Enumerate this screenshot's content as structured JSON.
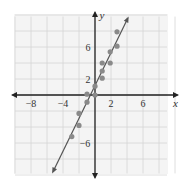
{
  "chart_data": {
    "type": "scatter",
    "title": "",
    "xlabel": "x",
    "ylabel": "y",
    "xlim": [
      -10,
      10
    ],
    "ylim": [
      -10,
      10
    ],
    "grid": true,
    "grid_step": 2,
    "x_tick_labels": [
      "-8",
      "-4",
      "2",
      "6"
    ],
    "y_tick_labels": [
      "2",
      "6",
      "-6"
    ],
    "series": [
      {
        "name": "data points",
        "points": [
          [
            2.75,
            7.9
          ],
          [
            2.75,
            6.1
          ],
          [
            1.9,
            5.4
          ],
          [
            0.9,
            4
          ],
          [
            1.9,
            4
          ],
          [
            0.9,
            3
          ],
          [
            0.9,
            2.1
          ],
          [
            0,
            1.1
          ],
          [
            -1,
            0.1
          ],
          [
            0,
            0
          ],
          [
            -1,
            -0.9
          ],
          [
            -2,
            -2.3
          ],
          [
            -2,
            -3.8
          ],
          [
            -2.9,
            -5.2
          ]
        ],
        "color": "#8a8a8a"
      },
      {
        "name": "regression line",
        "type": "line",
        "equation": "y = 2x + 1",
        "from": [
          -5.25,
          -9.6
        ],
        "to": [
          4.1,
          9.6
        ],
        "color": "#555555"
      }
    ]
  }
}
